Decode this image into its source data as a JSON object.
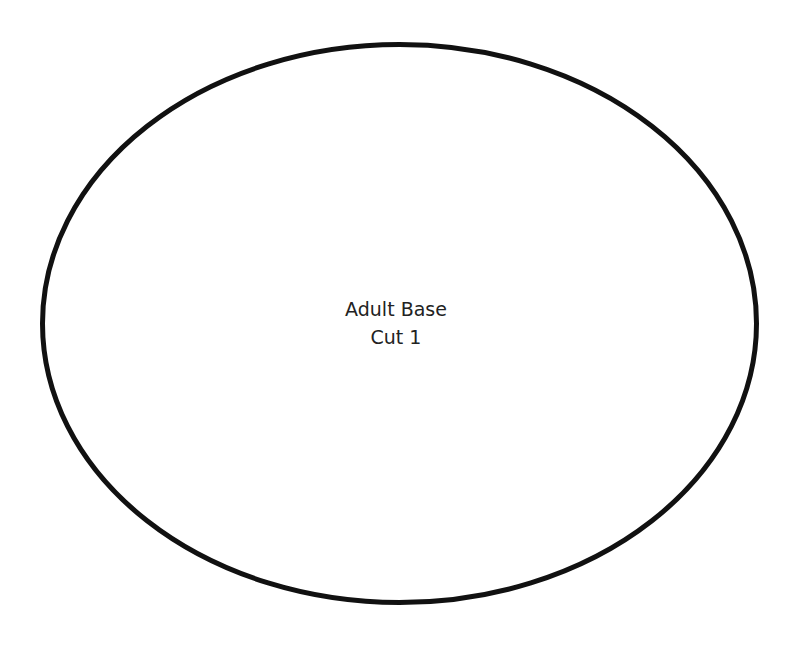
{
  "pattern": {
    "label_line1": "Adult Base",
    "label_line2": "Cut 1",
    "shape": "ellipse",
    "stroke_color": "#111111",
    "background": "#ffffff"
  }
}
